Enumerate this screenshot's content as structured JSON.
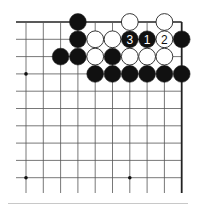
{
  "diagram": {
    "type": "go-board-corner",
    "corner": "top-right",
    "grid": {
      "columns": 10,
      "rows": 10,
      "x0": 26,
      "y0": 22,
      "spacing": 17.3,
      "line_color": "#555555",
      "edge_color": "#222222"
    },
    "star_points": [
      {
        "col": 0,
        "row": 3
      },
      {
        "col": 0,
        "row": 9
      },
      {
        "col": 6,
        "row": 9
      }
    ],
    "stones": [
      {
        "col": 3,
        "row": 0,
        "color": "black",
        "label": ""
      },
      {
        "col": 6,
        "row": 0,
        "color": "white",
        "label": ""
      },
      {
        "col": 8,
        "row": 0,
        "color": "white",
        "label": ""
      },
      {
        "col": 3,
        "row": 1,
        "color": "black",
        "label": ""
      },
      {
        "col": 4,
        "row": 1,
        "color": "white",
        "label": ""
      },
      {
        "col": 5,
        "row": 1,
        "color": "white",
        "label": ""
      },
      {
        "col": 6,
        "row": 1,
        "color": "black",
        "label": "3"
      },
      {
        "col": 7,
        "row": 1,
        "color": "black",
        "label": "1"
      },
      {
        "col": 8,
        "row": 1,
        "color": "white",
        "label": "2"
      },
      {
        "col": 9,
        "row": 1,
        "color": "black",
        "label": ""
      },
      {
        "col": 2,
        "row": 2,
        "color": "black",
        "label": ""
      },
      {
        "col": 3,
        "row": 2,
        "color": "black",
        "label": ""
      },
      {
        "col": 4,
        "row": 2,
        "color": "white",
        "label": ""
      },
      {
        "col": 5,
        "row": 2,
        "color": "black",
        "label": ""
      },
      {
        "col": 6,
        "row": 2,
        "color": "white",
        "label": ""
      },
      {
        "col": 7,
        "row": 2,
        "color": "white",
        "label": ""
      },
      {
        "col": 8,
        "row": 2,
        "color": "white",
        "label": ""
      },
      {
        "col": 4,
        "row": 3,
        "color": "black",
        "label": ""
      },
      {
        "col": 5,
        "row": 3,
        "color": "black",
        "label": ""
      },
      {
        "col": 6,
        "row": 3,
        "color": "black",
        "label": ""
      },
      {
        "col": 7,
        "row": 3,
        "color": "black",
        "label": ""
      },
      {
        "col": 8,
        "row": 3,
        "color": "black",
        "label": ""
      },
      {
        "col": 9,
        "row": 3,
        "color": "black",
        "label": ""
      }
    ],
    "move_labels": [
      "1",
      "2",
      "3"
    ]
  }
}
